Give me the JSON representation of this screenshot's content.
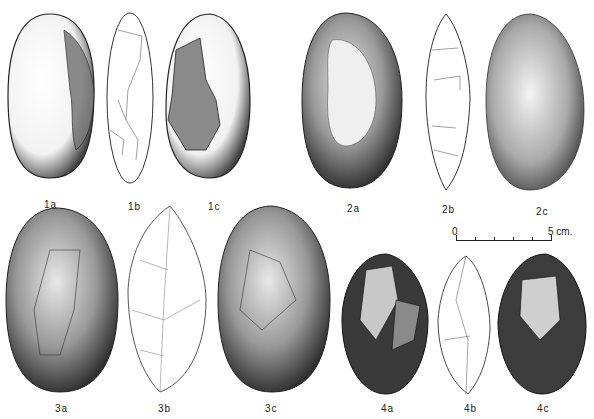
{
  "figure": {
    "type": "archaeological-illustration-plate",
    "labels": {
      "1a": "1a",
      "1b": "1b",
      "1c": "1c",
      "2a": "2a",
      "2b": "2b",
      "2c": "2c",
      "3a": "3a",
      "3b": "3b",
      "3c": "3c",
      "4a": "4a",
      "4b": "4b",
      "4c": "4c"
    },
    "scale_bar": {
      "start": "0",
      "end": "5 cm."
    }
  }
}
